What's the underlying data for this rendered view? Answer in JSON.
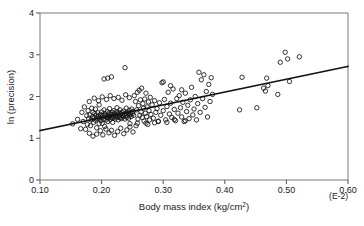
{
  "figure": {
    "background_color": "#ffffff",
    "frame_color": "#7a7a7a",
    "marker_color": "#111111",
    "line_color": "#111111"
  },
  "chart_data": {
    "type": "scatter",
    "title": "",
    "xlabel": "Body mass index (kg/cm",
    "xlabel_sup": "2",
    "xlabel_tail": ")",
    "ylabel": "ln (precision)",
    "x_unit_note": "(E-2)",
    "xlim": [
      0.1,
      0.6
    ],
    "ylim": [
      0,
      4
    ],
    "xticks": [
      0.1,
      0.2,
      0.3,
      0.4,
      0.5,
      0.6
    ],
    "xtick_labels": [
      "0.10",
      "0.20",
      "0.30",
      "0.40",
      "0.50",
      "0.60"
    ],
    "yticks": [
      0,
      1,
      2,
      3,
      4
    ],
    "ytick_labels": [
      "0",
      "1",
      "2",
      "3",
      "4"
    ],
    "grid": false,
    "legend": false,
    "marker": "open-circle",
    "marker_size": 4.4,
    "fit_line": {
      "x": [
        0.1,
        0.6
      ],
      "y": [
        1.185,
        2.72
      ],
      "slope": 3.07,
      "intercept": 0.878
    },
    "points": [
      [
        0.153,
        1.345
      ],
      [
        0.161,
        1.452
      ],
      [
        0.166,
        1.23
      ],
      [
        0.168,
        1.62
      ],
      [
        0.17,
        1.4
      ],
      [
        0.172,
        1.75
      ],
      [
        0.174,
        1.215
      ],
      [
        0.176,
        1.54
      ],
      [
        0.177,
        1.33
      ],
      [
        0.178,
        1.66
      ],
      [
        0.179,
        1.47
      ],
      [
        0.18,
        1.88
      ],
      [
        0.181,
        1.56
      ],
      [
        0.182,
        1.3
      ],
      [
        0.183,
        1.44
      ],
      [
        0.184,
        1.72
      ],
      [
        0.185,
        1.51
      ],
      [
        0.186,
        1.62
      ],
      [
        0.187,
        1.38
      ],
      [
        0.188,
        1.49
      ],
      [
        0.189,
        1.59
      ],
      [
        0.19,
        1.43
      ],
      [
        0.19,
        1.7
      ],
      [
        0.191,
        1.54
      ],
      [
        0.192,
        1.25
      ],
      [
        0.193,
        1.47
      ],
      [
        0.194,
        1.61
      ],
      [
        0.195,
        1.52
      ],
      [
        0.196,
        1.35
      ],
      [
        0.196,
        1.8
      ],
      [
        0.197,
        1.48
      ],
      [
        0.198,
        1.57
      ],
      [
        0.199,
        1.42
      ],
      [
        0.2,
        1.63
      ],
      [
        0.2,
        1.5
      ],
      [
        0.201,
        1.36
      ],
      [
        0.202,
        1.55
      ],
      [
        0.203,
        1.46
      ],
      [
        0.204,
        1.68
      ],
      [
        0.205,
        1.53
      ],
      [
        0.205,
        1.28
      ],
      [
        0.206,
        1.58
      ],
      [
        0.207,
        1.44
      ],
      [
        0.208,
        1.5
      ],
      [
        0.209,
        1.64
      ],
      [
        0.21,
        1.55
      ],
      [
        0.21,
        1.4
      ],
      [
        0.211,
        1.49
      ],
      [
        0.212,
        1.6
      ],
      [
        0.213,
        1.52
      ],
      [
        0.213,
        1.71
      ],
      [
        0.214,
        1.45
      ],
      [
        0.215,
        1.57
      ],
      [
        0.216,
        1.5
      ],
      [
        0.217,
        1.62
      ],
      [
        0.218,
        1.48
      ],
      [
        0.218,
        1.38
      ],
      [
        0.219,
        1.55
      ],
      [
        0.22,
        1.66
      ],
      [
        0.22,
        1.51
      ],
      [
        0.221,
        1.59
      ],
      [
        0.222,
        1.46
      ],
      [
        0.223,
        1.54
      ],
      [
        0.224,
        1.63
      ],
      [
        0.225,
        1.5
      ],
      [
        0.225,
        1.73
      ],
      [
        0.226,
        1.57
      ],
      [
        0.227,
        1.44
      ],
      [
        0.228,
        1.61
      ],
      [
        0.229,
        1.53
      ],
      [
        0.23,
        1.49
      ],
      [
        0.23,
        1.68
      ],
      [
        0.231,
        1.58
      ],
      [
        0.232,
        1.47
      ],
      [
        0.233,
        1.62
      ],
      [
        0.234,
        1.55
      ],
      [
        0.235,
        1.51
      ],
      [
        0.236,
        1.65
      ],
      [
        0.237,
        1.57
      ],
      [
        0.238,
        1.46
      ],
      [
        0.239,
        1.6
      ],
      [
        0.24,
        1.54
      ],
      [
        0.24,
        1.72
      ],
      [
        0.241,
        1.5
      ],
      [
        0.242,
        1.63
      ],
      [
        0.243,
        1.58
      ],
      [
        0.244,
        1.48
      ],
      [
        0.245,
        1.67
      ],
      [
        0.246,
        1.56
      ],
      [
        0.247,
        1.61
      ],
      [
        0.248,
        1.52
      ],
      [
        0.249,
        1.7
      ],
      [
        0.25,
        1.59
      ],
      [
        0.251,
        1.64
      ],
      [
        0.252,
        1.55
      ],
      [
        0.18,
        1.12
      ],
      [
        0.186,
        1.05
      ],
      [
        0.192,
        1.1
      ],
      [
        0.198,
        1.18
      ],
      [
        0.202,
        1.08
      ],
      [
        0.207,
        1.22
      ],
      [
        0.212,
        1.13
      ],
      [
        0.216,
        1.19
      ],
      [
        0.221,
        1.07
      ],
      [
        0.226,
        1.16
      ],
      [
        0.231,
        1.24
      ],
      [
        0.236,
        1.11
      ],
      [
        0.241,
        1.2
      ],
      [
        0.246,
        1.27
      ],
      [
        0.251,
        1.15
      ],
      [
        0.256,
        1.3
      ],
      [
        0.188,
        1.96
      ],
      [
        0.195,
        1.9
      ],
      [
        0.201,
        1.99
      ],
      [
        0.208,
        1.93
      ],
      [
        0.214,
        2.02
      ],
      [
        0.22,
        1.95
      ],
      [
        0.227,
        1.98
      ],
      [
        0.233,
        1.91
      ],
      [
        0.239,
        2.04
      ],
      [
        0.245,
        1.97
      ],
      [
        0.21,
        2.44
      ],
      [
        0.216,
        2.47
      ],
      [
        0.204,
        2.42
      ],
      [
        0.238,
        2.69
      ],
      [
        0.253,
        2.02
      ],
      [
        0.255,
        1.88
      ],
      [
        0.257,
        1.68
      ],
      [
        0.258,
        2.1
      ],
      [
        0.259,
        1.46
      ],
      [
        0.26,
        1.78
      ],
      [
        0.261,
        2.15
      ],
      [
        0.262,
        1.55
      ],
      [
        0.263,
        1.92
      ],
      [
        0.264,
        1.63
      ],
      [
        0.265,
        2.2
      ],
      [
        0.266,
        1.5
      ],
      [
        0.267,
        1.83
      ],
      [
        0.268,
        1.72
      ],
      [
        0.269,
        1.41
      ],
      [
        0.27,
        1.94
      ],
      [
        0.271,
        1.6
      ],
      [
        0.272,
        2.08
      ],
      [
        0.273,
        1.52
      ],
      [
        0.274,
        1.75
      ],
      [
        0.275,
        1.33
      ],
      [
        0.276,
        1.87
      ],
      [
        0.277,
        1.66
      ],
      [
        0.278,
        1.44
      ],
      [
        0.279,
        1.98
      ],
      [
        0.28,
        1.57
      ],
      [
        0.282,
        1.8
      ],
      [
        0.284,
        1.48
      ],
      [
        0.286,
        1.9
      ],
      [
        0.288,
        1.62
      ],
      [
        0.29,
        1.71
      ],
      [
        0.292,
        1.4
      ],
      [
        0.294,
        1.85
      ],
      [
        0.296,
        1.55
      ],
      [
        0.298,
        2.33
      ],
      [
        0.3,
        1.66
      ],
      [
        0.302,
        1.93
      ],
      [
        0.304,
        1.44
      ],
      [
        0.306,
        1.76
      ],
      [
        0.308,
        2.1
      ],
      [
        0.31,
        1.58
      ],
      [
        0.312,
        1.84
      ],
      [
        0.314,
        1.5
      ],
      [
        0.316,
        2.18
      ],
      [
        0.318,
        1.69
      ],
      [
        0.32,
        1.42
      ],
      [
        0.322,
        1.95
      ],
      [
        0.324,
        1.6
      ],
      [
        0.326,
        2.02
      ],
      [
        0.328,
        1.73
      ],
      [
        0.33,
        1.51
      ],
      [
        0.332,
        1.86
      ],
      [
        0.334,
        1.4
      ],
      [
        0.336,
        2.08
      ],
      [
        0.338,
        1.64
      ],
      [
        0.34,
        1.79
      ],
      [
        0.342,
        1.47
      ],
      [
        0.344,
        1.92
      ],
      [
        0.346,
        2.22
      ],
      [
        0.348,
        1.56
      ],
      [
        0.35,
        1.7
      ],
      [
        0.352,
        2.0
      ],
      [
        0.354,
        1.44
      ],
      [
        0.356,
        1.83
      ],
      [
        0.358,
        2.58
      ],
      [
        0.36,
        1.62
      ],
      [
        0.362,
        2.4
      ],
      [
        0.364,
        1.95
      ],
      [
        0.366,
        2.52
      ],
      [
        0.368,
        1.74
      ],
      [
        0.37,
        2.12
      ],
      [
        0.372,
        1.51
      ],
      [
        0.374,
        2.29
      ],
      [
        0.376,
        1.88
      ],
      [
        0.378,
        2.45
      ],
      [
        0.38,
        2.05
      ],
      [
        0.3,
        2.35
      ],
      [
        0.306,
        1.38
      ],
      [
        0.312,
        2.26
      ],
      [
        0.318,
        1.45
      ],
      [
        0.33,
        2.16
      ],
      [
        0.336,
        1.42
      ],
      [
        0.286,
        1.37
      ],
      [
        0.292,
        1.41
      ],
      [
        0.424,
        1.68
      ],
      [
        0.428,
        2.46
      ],
      [
        0.452,
        1.73
      ],
      [
        0.463,
        2.2
      ],
      [
        0.466,
        2.13
      ],
      [
        0.468,
        2.44
      ],
      [
        0.47,
        2.26
      ],
      [
        0.486,
        2.05
      ],
      [
        0.49,
        2.82
      ],
      [
        0.498,
        3.06
      ],
      [
        0.502,
        2.9
      ],
      [
        0.505,
        2.36
      ],
      [
        0.521,
        2.95
      ],
      [
        0.258,
        1.36
      ],
      [
        0.246,
        1.35
      ],
      [
        0.272,
        1.36
      ]
    ]
  }
}
